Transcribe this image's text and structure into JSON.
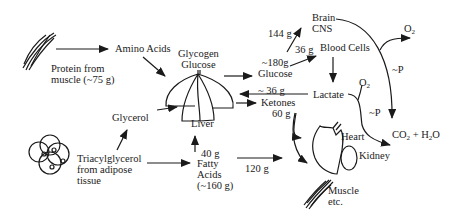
{
  "diagram": {
    "nodes": {
      "protein": {
        "line1": "Protein from",
        "line2": "muscle (~75 g)"
      },
      "amino_acids": "Amino Acids",
      "glycogen": {
        "line1": "Glycogen",
        "line2": "Glucose"
      },
      "liver": "Liver",
      "glycerol": "Glycerol",
      "tag": {
        "line1": "Triacylglycerol",
        "line2": "from adipose",
        "line3": "tissue"
      },
      "fatty_acids": {
        "line1": "Fatty",
        "line2": "Acids",
        "line3": "(~160 g)"
      },
      "brain": {
        "line1": "Brain",
        "line2": "CNS"
      },
      "blood_cells": "Blood Cells",
      "lactate": "Lactate",
      "ketones": "Ketones",
      "heart": "Heart",
      "kidney": "Kidney",
      "muscle": {
        "line1": "Muscle",
        "line2": "etc."
      },
      "o2_top": "O",
      "o2_mid": "O",
      "o2_sub": "2",
      "co2_h2o": {
        "a": "CO",
        "b": "2",
        "c": " + H",
        "d": "2",
        "e": "O"
      }
    },
    "edge_labels": {
      "brain_glucose": "144 g",
      "blood_glucose": "36 g",
      "glucose_amount": "~180g",
      "glucose": "Glucose",
      "lactate_return": "~ 36 g",
      "ketones_amount": "60 g",
      "fa_to_liver": "40 g",
      "fa_to_muscle": "120 g",
      "p_top": "~P",
      "p_mid": "~P"
    }
  }
}
